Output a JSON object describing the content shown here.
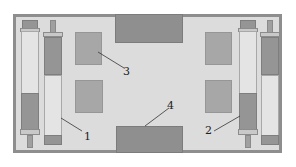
{
  "diagram": {
    "type": "technical-schematic",
    "colors": {
      "background": "#ffffff",
      "frame_fill": "#dcdcdc",
      "frame_border": "#8e8e8e",
      "block_fill": "#8f8f8f",
      "pad_fill": "#a7a7a7",
      "cylinder_light": "#e4e4e4",
      "cylinder_dark": "#959595"
    },
    "labels": [
      {
        "id": "1",
        "text": "1",
        "target": "left-cylinder-inner"
      },
      {
        "id": "2",
        "text": "2",
        "target": "right-cylinder-inner"
      },
      {
        "id": "3",
        "text": "3",
        "target": "pad-upper-left"
      },
      {
        "id": "4",
        "text": "4",
        "target": "center-block-bottom"
      }
    ]
  }
}
